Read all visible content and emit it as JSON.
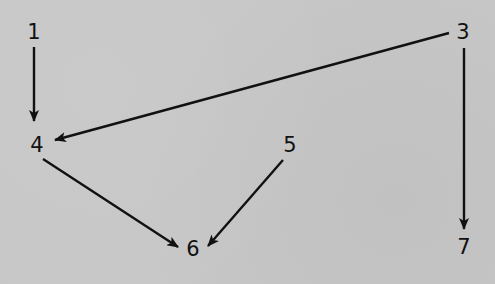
{
  "diagram": {
    "type": "directed-graph",
    "background_color": "#c7c7c7",
    "stroke_color": "#111111",
    "nodes": [
      {
        "id": "1",
        "label": "1",
        "x": 34,
        "y": 32
      },
      {
        "id": "3",
        "label": "3",
        "x": 463,
        "y": 32
      },
      {
        "id": "4",
        "label": "4",
        "x": 37,
        "y": 145
      },
      {
        "id": "5",
        "label": "5",
        "x": 290,
        "y": 145
      },
      {
        "id": "6",
        "label": "6",
        "x": 193,
        "y": 249
      },
      {
        "id": "7",
        "label": "7",
        "x": 464,
        "y": 247
      }
    ],
    "edges": [
      {
        "from": "1",
        "to": "4"
      },
      {
        "from": "3",
        "to": "4"
      },
      {
        "from": "3",
        "to": "7"
      },
      {
        "from": "4",
        "to": "6"
      },
      {
        "from": "5",
        "to": "6"
      }
    ]
  }
}
